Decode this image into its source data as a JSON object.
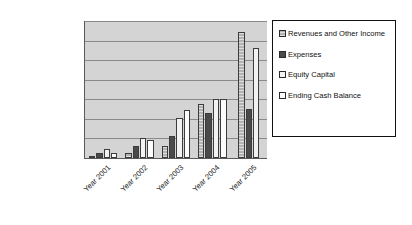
{
  "chart_data": {
    "type": "bar",
    "title": "",
    "xlabel": "",
    "ylabel": "",
    "ylim": [
      0,
      35000000
    ],
    "ytick_step": 5000000,
    "grid": true,
    "legend_position": "right",
    "categories": [
      "Year 2001",
      "Year 2002",
      "Year 2003",
      "Year 2004",
      "Year 2005"
    ],
    "ytick_labels": [
      "$35,000,000",
      "$30,000,000",
      "$25,000,000",
      "$20,000,000",
      "$15,000,000",
      "$10,000,000",
      "$5,000,000",
      "$0"
    ],
    "series": [
      {
        "name": "Revenues and Other Income",
        "swatch": "#b3b3b3",
        "fill": "fill-revenues",
        "values": [
          600000,
          1300000,
          3000000,
          13800000,
          32300000
        ]
      },
      {
        "name": "Expenses",
        "swatch": "#4a4a4a",
        "fill": "fill-expenses",
        "values": [
          1300000,
          3000000,
          5500000,
          11500000,
          12500000
        ]
      },
      {
        "name": "Equity Capital",
        "swatch": "#f2f2f2",
        "fill": "fill-equity",
        "values": [
          2200000,
          5200000,
          10200000,
          15000000,
          28000000
        ]
      },
      {
        "name": "Ending Cash Balance",
        "swatch": "#fcfcfc",
        "fill": "fill-cash",
        "values": [
          1200000,
          4700000,
          12300000,
          15000000,
          0
        ]
      }
    ]
  },
  "legend": {
    "items": [
      {
        "label": "Revenues and Other Income"
      },
      {
        "label": "Expenses"
      },
      {
        "label": "Equity Capital"
      },
      {
        "label": "Ending Cash Balance"
      }
    ]
  },
  "colors": {
    "plot_background": "#d4d4d4",
    "gridline": "#8a8a8a",
    "axis": "#5a5a5a",
    "legend_border": "#111111",
    "text": "#1a1a1a"
  }
}
